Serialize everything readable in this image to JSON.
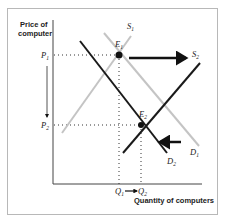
{
  "diagram": {
    "y_axis_title_line1": "Price of",
    "y_axis_title_line2": "computer",
    "x_axis_title": "Quantity of computers",
    "price_labels": [
      {
        "letter": "P",
        "sub": "1"
      },
      {
        "letter": "P",
        "sub": "2"
      }
    ],
    "quantity_labels": [
      {
        "letter": "Q",
        "sub": "1"
      },
      {
        "letter": "Q",
        "sub": "2"
      }
    ],
    "curves": {
      "S1": {
        "letter": "S",
        "sub": "1",
        "color": "#c4c4c4"
      },
      "S2": {
        "letter": "S",
        "sub": "2",
        "color": "#1a1a1a"
      },
      "D1": {
        "letter": "D",
        "sub": "1",
        "color": "#c4c4c4"
      },
      "D2": {
        "letter": "D",
        "sub": "2",
        "color": "#1a1a1a"
      }
    },
    "equilibria": {
      "E1": {
        "letter": "E",
        "sub": "1"
      },
      "E2": {
        "letter": "E",
        "sub": "2"
      }
    },
    "shifts": {
      "supply": "rightward",
      "demand": "leftward",
      "price": "P1 to P2 (decrease)",
      "quantity": "Q1 to Q2 (increase)"
    }
  }
}
